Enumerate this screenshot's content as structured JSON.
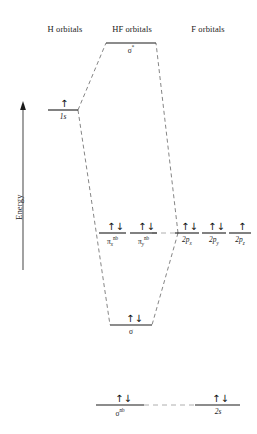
{
  "diagram": {
    "title_columns": {
      "left": "H orbitals",
      "center": "HF orbitals",
      "right": "F orbitals"
    },
    "axis": {
      "label": "Energy",
      "direction": "up",
      "arrow_icon": "up-arrow-icon"
    },
    "colors": {
      "ink": "#1a1a1a",
      "level_line": "#1a1a1a",
      "correlation_line": "#555555",
      "background": "#ffffff"
    },
    "spin_glyphs": {
      "paired": "↑↓",
      "single_up": "↑"
    },
    "levels": [
      {
        "id": "sigma-star",
        "column": "center",
        "label_plain": "σ*",
        "occupancy": "empty",
        "electrons": "",
        "energy_rank": 1
      },
      {
        "id": "h-1s",
        "column": "left",
        "label_plain": "1s",
        "occupancy": "half",
        "electrons": "↑",
        "energy_rank": 2
      },
      {
        "id": "pi-x-nb",
        "column": "center",
        "label_plain": "πx nb",
        "occupancy": "full",
        "electrons": "↑↓",
        "energy_rank": 3
      },
      {
        "id": "pi-y-nb",
        "column": "center",
        "label_plain": "πy nb",
        "occupancy": "full",
        "electrons": "↑↓",
        "energy_rank": 3
      },
      {
        "id": "f-2px",
        "column": "right",
        "label_plain": "2px",
        "occupancy": "full",
        "electrons": "↑↓",
        "energy_rank": 3
      },
      {
        "id": "f-2py",
        "column": "right",
        "label_plain": "2py",
        "occupancy": "full",
        "electrons": "↑↓",
        "energy_rank": 3
      },
      {
        "id": "f-2pz",
        "column": "right",
        "label_plain": "2pz",
        "occupancy": "half",
        "electrons": "↑",
        "energy_rank": 3
      },
      {
        "id": "sigma",
        "column": "center",
        "label_plain": "σ",
        "occupancy": "full",
        "electrons": "↑↓",
        "energy_rank": 4
      },
      {
        "id": "sigma-nb",
        "column": "center",
        "label_plain": "σ nb",
        "occupancy": "full",
        "electrons": "↑↓",
        "energy_rank": 5
      },
      {
        "id": "f-2s",
        "column": "right",
        "label_plain": "2s",
        "occupancy": "full",
        "electrons": "↑↓",
        "energy_rank": 5
      }
    ]
  }
}
